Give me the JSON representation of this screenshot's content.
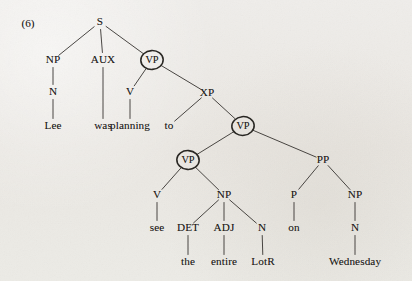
{
  "figure": {
    "example_number": "(6)",
    "type": "syntax-tree",
    "sentence": "Lee was planning to see the entire LotR on Wednesday",
    "circled_nodes": [
      "VP",
      "VP",
      "VP"
    ],
    "ink_color": "#33302c",
    "paper_color": "#edebe7"
  },
  "nodes": [
    {
      "id": "S",
      "label": "S",
      "x": 100,
      "y": 22,
      "circled": false
    },
    {
      "id": "NP1",
      "label": "NP",
      "x": 53,
      "y": 60,
      "circled": false
    },
    {
      "id": "AUX",
      "label": "AUX",
      "x": 103,
      "y": 60,
      "circled": false
    },
    {
      "id": "VP1",
      "label": "VP",
      "x": 152,
      "y": 60,
      "circled": true
    },
    {
      "id": "N1",
      "label": "N",
      "x": 53,
      "y": 92,
      "circled": false
    },
    {
      "id": "V1",
      "label": "V",
      "x": 130,
      "y": 92,
      "circled": false
    },
    {
      "id": "XP",
      "label": "XP",
      "x": 207,
      "y": 93,
      "circled": false
    },
    {
      "id": "VP2",
      "label": "VP",
      "x": 243,
      "y": 126,
      "circled": true
    },
    {
      "id": "VP3",
      "label": "VP",
      "x": 188,
      "y": 160,
      "circled": true
    },
    {
      "id": "PP",
      "label": "PP",
      "x": 323,
      "y": 160,
      "circled": false
    },
    {
      "id": "V2",
      "label": "V",
      "x": 157,
      "y": 195,
      "circled": false
    },
    {
      "id": "NP2",
      "label": "NP",
      "x": 224,
      "y": 195,
      "circled": false
    },
    {
      "id": "P",
      "label": "P",
      "x": 294,
      "y": 195,
      "circled": false
    },
    {
      "id": "NP3",
      "label": "NP",
      "x": 355,
      "y": 195,
      "circled": false
    },
    {
      "id": "DET",
      "label": "DET",
      "x": 188,
      "y": 228,
      "circled": false
    },
    {
      "id": "ADJ",
      "label": "ADJ",
      "x": 224,
      "y": 228,
      "circled": false
    },
    {
      "id": "N2",
      "label": "N",
      "x": 262,
      "y": 228,
      "circled": false
    },
    {
      "id": "N3",
      "label": "N",
      "x": 355,
      "y": 228,
      "circled": false
    }
  ],
  "leaves": [
    {
      "id": "leaf-lee",
      "label": "Lee",
      "x": 53,
      "y": 126
    },
    {
      "id": "leaf-was",
      "label": "was",
      "x": 103,
      "y": 126
    },
    {
      "id": "leaf-planning",
      "label": "planning",
      "x": 130,
      "y": 126
    },
    {
      "id": "leaf-to",
      "label": "to",
      "x": 169,
      "y": 126
    },
    {
      "id": "leaf-see",
      "label": "see",
      "x": 157,
      "y": 228
    },
    {
      "id": "leaf-on",
      "label": "on",
      "x": 294,
      "y": 228
    },
    {
      "id": "leaf-the",
      "label": "the",
      "x": 188,
      "y": 262
    },
    {
      "id": "leaf-entire",
      "label": "entire",
      "x": 224,
      "y": 262
    },
    {
      "id": "leaf-lotr",
      "label": "LotR",
      "x": 263,
      "y": 262
    },
    {
      "id": "leaf-wednesday",
      "label": "Wednesday",
      "x": 355,
      "y": 262
    }
  ],
  "edges": [
    {
      "from": "S",
      "to": "NP1"
    },
    {
      "from": "S",
      "to": "AUX"
    },
    {
      "from": "S",
      "to": "VP1"
    },
    {
      "from": "NP1",
      "to": "N1"
    },
    {
      "from": "N1",
      "to": "leaf-lee"
    },
    {
      "from": "AUX",
      "to": "leaf-was"
    },
    {
      "from": "VP1",
      "to": "V1"
    },
    {
      "from": "VP1",
      "to": "XP"
    },
    {
      "from": "V1",
      "to": "leaf-planning"
    },
    {
      "from": "XP",
      "to": "leaf-to"
    },
    {
      "from": "XP",
      "to": "VP2"
    },
    {
      "from": "VP2",
      "to": "VP3"
    },
    {
      "from": "VP2",
      "to": "PP"
    },
    {
      "from": "VP3",
      "to": "V2"
    },
    {
      "from": "VP3",
      "to": "NP2"
    },
    {
      "from": "V2",
      "to": "leaf-see"
    },
    {
      "from": "NP2",
      "to": "DET"
    },
    {
      "from": "NP2",
      "to": "ADJ"
    },
    {
      "from": "NP2",
      "to": "N2"
    },
    {
      "from": "DET",
      "to": "leaf-the"
    },
    {
      "from": "ADJ",
      "to": "leaf-entire"
    },
    {
      "from": "N2",
      "to": "leaf-lotr"
    },
    {
      "from": "PP",
      "to": "P"
    },
    {
      "from": "PP",
      "to": "NP3"
    },
    {
      "from": "P",
      "to": "leaf-on"
    },
    {
      "from": "NP3",
      "to": "N3"
    },
    {
      "from": "N3",
      "to": "leaf-wednesday"
    }
  ]
}
